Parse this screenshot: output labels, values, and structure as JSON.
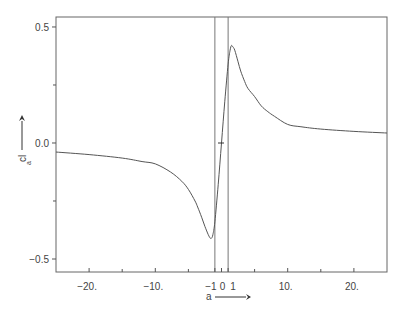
{
  "chart_data": {
    "type": "line",
    "title": "",
    "xlabel": "a",
    "ylabel": "c_la",
    "xlim": [
      -25,
      25
    ],
    "ylim": [
      -0.556,
      0.543
    ],
    "grid": false,
    "legend": null,
    "x_ticks": [
      {
        "value": -20,
        "label": "−20."
      },
      {
        "value": -10,
        "label": "−10."
      },
      {
        "value": -1,
        "label": "−1"
      },
      {
        "value": 0,
        "label": "0"
      },
      {
        "value": 1,
        "label": "1"
      },
      {
        "value": 10,
        "label": "10."
      },
      {
        "value": 20,
        "label": "20."
      }
    ],
    "x_minor_ticks": [
      -15,
      -5,
      5,
      15
    ],
    "y_ticks": [
      {
        "value": 0.5,
        "label": "0.5"
      },
      {
        "value": 0.0,
        "label": "0.0"
      },
      {
        "value": -0.5,
        "label": "−0.5"
      }
    ],
    "y_minor_ticks": [
      0.25,
      -0.25
    ],
    "reference_lines": [
      {
        "orientation": "vertical",
        "x": -1
      },
      {
        "orientation": "vertical",
        "x": 1
      }
    ],
    "series": [
      {
        "name": "c_la(a)",
        "color": "#555555",
        "x": [
          -25,
          -20,
          -15,
          -12,
          -10,
          -7.7,
          -6,
          -5,
          -4,
          -3.6,
          -3,
          -2.5,
          -2,
          -1.7,
          -1.5,
          -1.3,
          -1,
          -0.5,
          0,
          0.5,
          1,
          1.3,
          1.5,
          1.7,
          2,
          2.5,
          2.9,
          3.5,
          4,
          5,
          6,
          7,
          8,
          10,
          12,
          15,
          20,
          25
        ],
        "values": [
          -0.039,
          -0.05,
          -0.065,
          -0.08,
          -0.09,
          -0.125,
          -0.165,
          -0.2,
          -0.25,
          -0.276,
          -0.32,
          -0.36,
          -0.395,
          -0.41,
          -0.41,
          -0.395,
          -0.34,
          -0.18,
          0.0,
          0.18,
          0.34,
          0.4,
          0.42,
          0.415,
          0.4,
          0.35,
          0.31,
          0.265,
          0.235,
          0.2,
          0.16,
          0.135,
          0.115,
          0.08,
          0.07,
          0.06,
          0.05,
          0.043
        ]
      }
    ],
    "annotations": [
      {
        "text": "a",
        "note": "x-axis label with right-pointing arrow"
      },
      {
        "text": "c_la",
        "note": "rotated y-axis label with upward arrow"
      }
    ]
  },
  "labels": {
    "xlabel": "a",
    "ylabel_main": "c",
    "ylabel_sub1": "l",
    "ylabel_sub2": "a"
  }
}
